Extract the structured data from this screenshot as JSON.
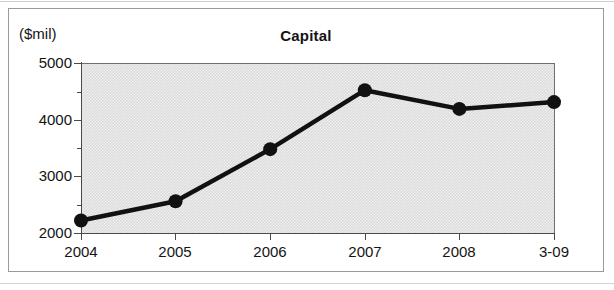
{
  "figure": {
    "title": "Capital",
    "unit_label": "($mil)"
  },
  "chart_data": {
    "type": "line",
    "title": "Capital",
    "xlabel": "",
    "ylabel": "($mil)",
    "categories": [
      "2004",
      "2005",
      "2006",
      "2007",
      "2008",
      "3-09"
    ],
    "values": [
      2220,
      2560,
      3480,
      4520,
      4190,
      4310
    ],
    "series": [
      {
        "name": "Capital",
        "values": [
          2220,
          2560,
          3480,
          4520,
          4190,
          4310
        ]
      }
    ],
    "ylim": [
      2000,
      5000
    ],
    "y_major_ticks": [
      "2000",
      "3000",
      "4000",
      "5000"
    ],
    "y_minor_ticks": [
      2500,
      3500,
      4500
    ],
    "grid": false,
    "legend": "none",
    "marker": "filled-circle",
    "line_color": "#111111",
    "plot_background": "#dcdcdc"
  },
  "axis": {
    "y_labels": [
      "5000",
      "4000",
      "3000",
      "2000"
    ],
    "x_labels": [
      "2004",
      "2005",
      "2006",
      "2007",
      "2008",
      "3-09"
    ]
  }
}
